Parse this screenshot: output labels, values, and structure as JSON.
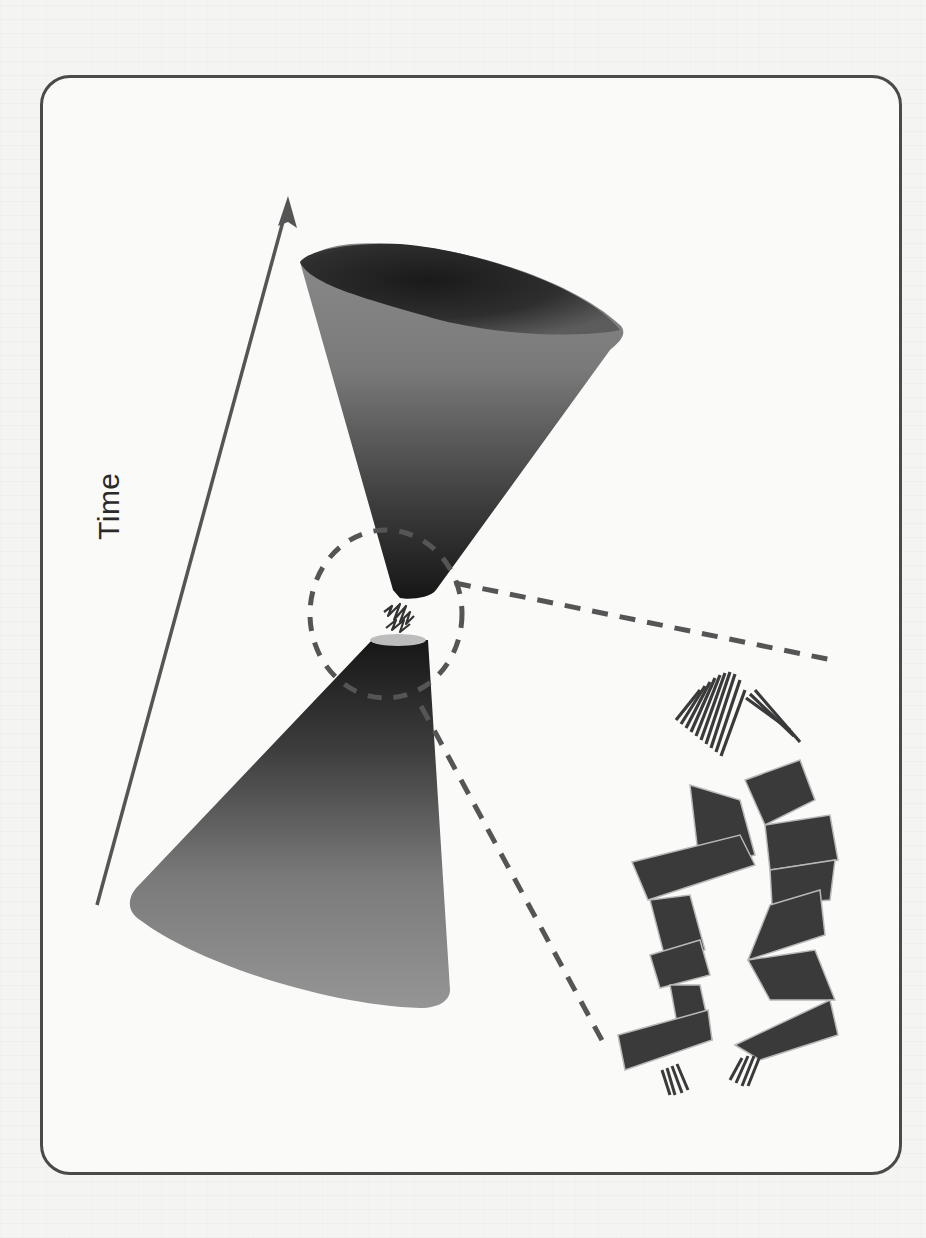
{
  "figure": {
    "type": "spacetime-bounce-diagram",
    "axis_label": "Time",
    "elements": [
      {
        "name": "time-arrow",
        "description": "diagonal arrow pointing upward-right"
      },
      {
        "name": "upper-cone",
        "description": "expanding future cone, dark gradient"
      },
      {
        "name": "lower-cone",
        "description": "contracting past cone, dark-to-grey gradient"
      },
      {
        "name": "quantum-bridge",
        "description": "wavy zigzag squiggle connecting cone tips"
      },
      {
        "name": "zoom-circle",
        "description": "dashed circle around bounce region"
      },
      {
        "name": "zoom-leader-lines",
        "description": "two dashed lines leading to inset"
      },
      {
        "name": "ribbon-inset",
        "description": "magnified twisted double-ribbon structure"
      }
    ]
  },
  "colors": {
    "frame": "#4a4a4a",
    "cone_dark": "#1c1c1c",
    "cone_light": "#9a9a9a",
    "dash": "#555555",
    "ribbon": "#3a3a3a",
    "ribbon_edge": "#b8b8b8"
  }
}
